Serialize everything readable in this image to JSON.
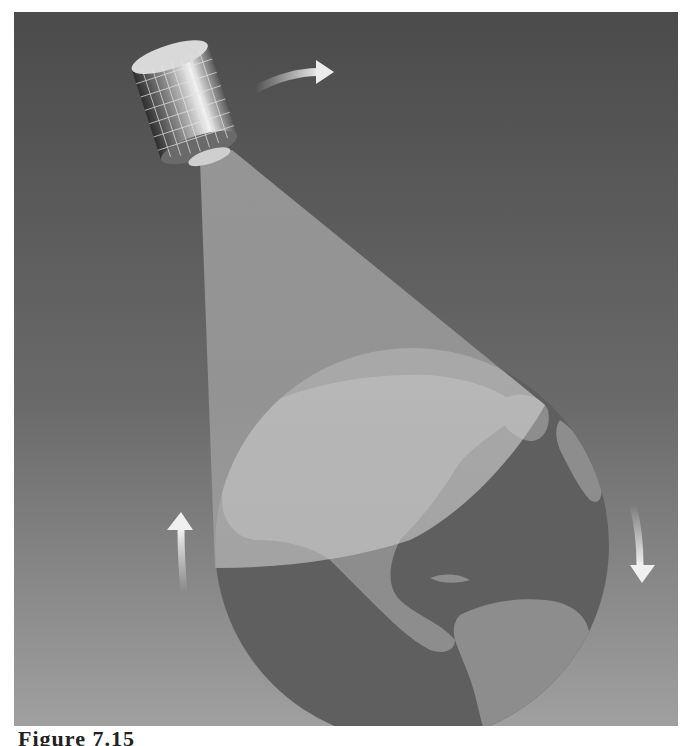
{
  "figure": {
    "caption": "Figure 7.15"
  },
  "colors": {
    "background_top": "#4a4a4a",
    "background_bottom": "#9a9a9a",
    "beam": "#bdbdbd",
    "ocean": "#5e5e5e",
    "land": "#8e8e8e",
    "arrow": "#e6e6e6"
  },
  "elements": {
    "satellite": "satellite-icon",
    "beam": "coverage-beam",
    "earth": "earth-globe",
    "arrows": [
      "orbit-direction-arrow",
      "rotation-arrow-up",
      "rotation-arrow-down"
    ]
  }
}
